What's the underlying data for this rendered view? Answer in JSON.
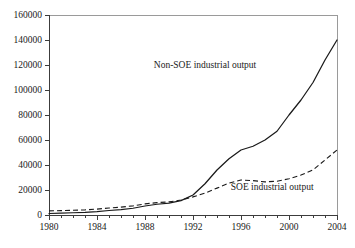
{
  "chart_data": {
    "type": "line",
    "title": "",
    "xlabel": "",
    "ylabel": "",
    "xlim": [
      1980,
      2004
    ],
    "ylim": [
      0,
      160000
    ],
    "grid": false,
    "legend_position": "inline-annotations",
    "x_major_ticks": [
      1980,
      1984,
      1988,
      1992,
      1996,
      2000,
      2004
    ],
    "x_minor_tick_step": 1,
    "y_ticks": [
      0,
      20000,
      40000,
      60000,
      80000,
      100000,
      120000,
      140000,
      160000
    ],
    "x_tick_labels": [
      "1980",
      "1984",
      "1988",
      "1992",
      "1996",
      "2000",
      "2004"
    ],
    "y_tick_labels": [
      "0",
      "20000",
      "40000",
      "60000",
      "80000",
      "100000",
      "120000",
      "140000",
      "160000"
    ],
    "x": [
      1980,
      1981,
      1982,
      1983,
      1984,
      1985,
      1986,
      1987,
      1988,
      1989,
      1990,
      1991,
      1992,
      1993,
      1994,
      1995,
      1996,
      1997,
      1998,
      1999,
      2000,
      2001,
      2002,
      2003,
      2004
    ],
    "series": [
      {
        "name": "Non-SOE industrial output",
        "style": "solid",
        "values": [
          1200,
          1500,
          1800,
          2100,
          2700,
          3600,
          4300,
          5400,
          7200,
          8600,
          9500,
          11500,
          16000,
          25000,
          36000,
          45000,
          52000,
          55000,
          60000,
          67000,
          80000,
          92000,
          106000,
          124000,
          140000
        ]
      },
      {
        "name": "SOE industrial output",
        "style": "dashed",
        "values": [
          3300,
          3500,
          3800,
          4100,
          4700,
          5600,
          6300,
          7300,
          8900,
          9900,
          10500,
          12000,
          14500,
          17500,
          21500,
          25500,
          28000,
          27500,
          26500,
          27000,
          29000,
          32000,
          36000,
          44000,
          52000
        ]
      }
    ],
    "annotations": [
      {
        "text": "Non-SOE industrial output",
        "target_x": 1996,
        "target_y": 52000,
        "label_x": 1993.0,
        "label_y": 118000
      },
      {
        "text": "SOE industrial output",
        "target_x": 1995,
        "target_y": 25500,
        "label_x": 1998.6,
        "label_y": 20000
      }
    ]
  }
}
